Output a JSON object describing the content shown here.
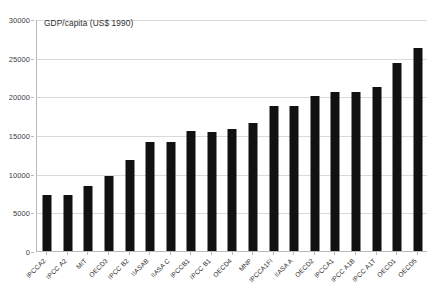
{
  "chart_data": {
    "type": "bar",
    "title": "GDP/capita (US$ 1990)",
    "xlabel": "",
    "ylabel": "",
    "ylim": [
      0,
      30000
    ],
    "ytick_step": 5000,
    "yticks": [
      "0",
      "5000",
      "10000",
      "15000",
      "20000",
      "25000",
      "30000"
    ],
    "grid": true,
    "legend": "none",
    "bar_color": "#111111",
    "grid_color": "#d9d9d9",
    "axis_color": "#b9b9b9",
    "categories": [
      "IPCCA2",
      "IPCC A2",
      "MIT",
      "OECD3",
      "IPCC B2",
      "IIASAB",
      "IIASA C",
      "IPCCB1",
      "IPCC B1",
      "OECD4",
      "MNP",
      "IPCCA1FI",
      "IIASA A",
      "OECD2",
      "IPCCA1",
      "IPCC A1B",
      "IPCC A1T",
      "OECD1",
      "OECD5"
    ],
    "values": [
      7200,
      7200,
      8400,
      9700,
      11800,
      14100,
      14100,
      15500,
      15400,
      15800,
      16600,
      18700,
      18800,
      20100,
      20600,
      20600,
      21200,
      24300,
      26300
    ]
  }
}
